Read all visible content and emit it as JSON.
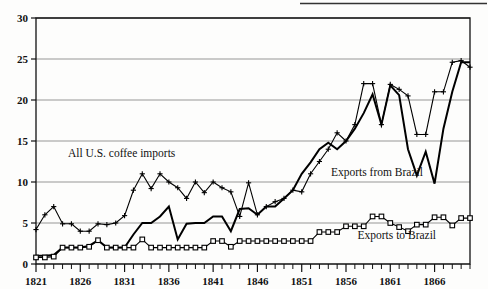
{
  "figure": {
    "background_color": "#fdfdfc",
    "ink_color": "#111111",
    "grid_color": "#6b6b6b"
  },
  "chart_data": {
    "type": "line",
    "title": "",
    "subtitle": "",
    "xlabel": "",
    "ylabel": "",
    "xlim": [
      1821,
      1870
    ],
    "ylim": [
      0,
      30
    ],
    "yticks": [
      0,
      5,
      10,
      15,
      20,
      25,
      30
    ],
    "ytick_labels": [
      "0",
      "5",
      "10",
      "15",
      "20",
      "25",
      "30"
    ],
    "xticks_labeled": [
      1821,
      1826,
      1831,
      1836,
      1841,
      1846,
      1851,
      1856,
      1861,
      1866
    ],
    "xtick_labels": [
      "1821",
      "1826",
      "1831",
      "1836",
      "1841",
      "1846",
      "1851",
      "1856",
      "1861",
      "1866"
    ],
    "xtick_minor_every": 1,
    "grid": "horizontal",
    "legend_position": "inline-annotations",
    "x": [
      1821,
      1822,
      1823,
      1824,
      1825,
      1826,
      1827,
      1828,
      1829,
      1830,
      1831,
      1832,
      1833,
      1834,
      1835,
      1836,
      1837,
      1838,
      1839,
      1840,
      1841,
      1842,
      1843,
      1844,
      1845,
      1846,
      1847,
      1848,
      1849,
      1850,
      1851,
      1852,
      1853,
      1854,
      1855,
      1856,
      1857,
      1858,
      1859,
      1860,
      1861,
      1862,
      1863,
      1864,
      1865,
      1866,
      1867,
      1868,
      1869,
      1870
    ],
    "series": [
      {
        "name": "All U.S. coffee imports",
        "marker": "plus",
        "line_width": 1.1,
        "annotation": "All U.S. coffee imports",
        "annotation_x": 1824.6,
        "annotation_y": 13.0,
        "values": [
          4.2,
          6.0,
          7.0,
          4.9,
          4.9,
          4.0,
          4.0,
          4.9,
          4.8,
          5.0,
          5.9,
          9.0,
          11.0,
          9.2,
          11.0,
          10.0,
          9.3,
          8.0,
          10.0,
          8.7,
          10.0,
          9.3,
          8.8,
          5.8,
          9.9,
          6.0,
          7.0,
          7.6,
          8.0,
          9.0,
          8.8,
          11.0,
          12.5,
          14.0,
          16.0,
          15.0,
          17.0,
          22.0,
          22.0,
          17.0,
          21.9,
          21.3,
          20.5,
          15.8,
          15.8,
          21.0,
          21.0,
          24.6,
          24.8,
          24.0
        ]
      },
      {
        "name": "Exports from Brazil",
        "marker": "none",
        "line_width": 2.0,
        "annotation": "Exports from Brazil",
        "annotation_x": 1854.3,
        "annotation_y": 10.7,
        "values": [
          1.0,
          1.0,
          1.1,
          2.0,
          2.0,
          2.0,
          2.2,
          2.9,
          2.0,
          2.0,
          2.0,
          3.6,
          5.0,
          5.0,
          5.8,
          7.0,
          3.0,
          4.9,
          5.0,
          5.0,
          5.8,
          5.8,
          4.0,
          6.7,
          6.8,
          6.0,
          7.0,
          7.0,
          8.0,
          9.0,
          11.0,
          12.4,
          14.0,
          14.8,
          14.0,
          15.0,
          16.5,
          18.4,
          20.7,
          17.0,
          21.8,
          20.6,
          14.0,
          10.8,
          13.7,
          9.8,
          16.5,
          21.0,
          24.6,
          24.6
        ]
      },
      {
        "name": "Exports to Brazil",
        "marker": "square",
        "line_width": 1.1,
        "annotation": "Exports to Brazil",
        "annotation_x": 1857.3,
        "annotation_y": 3.0,
        "values": [
          0.8,
          0.8,
          0.9,
          2.0,
          2.0,
          2.0,
          2.1,
          2.9,
          2.0,
          2.0,
          2.0,
          2.0,
          3.0,
          2.0,
          2.0,
          2.0,
          2.0,
          2.0,
          2.0,
          2.0,
          2.8,
          2.8,
          2.1,
          2.8,
          2.8,
          2.8,
          2.8,
          2.8,
          2.8,
          2.8,
          2.8,
          2.8,
          3.9,
          3.9,
          3.9,
          4.6,
          4.6,
          4.6,
          5.8,
          5.8,
          5.0,
          4.5,
          4.0,
          4.8,
          4.8,
          5.7,
          5.7,
          4.7,
          5.6,
          5.6
        ]
      }
    ],
    "annotations": [
      {
        "text": "All U.S. coffee imports",
        "x": 1824.6,
        "y": 13.0
      },
      {
        "text": "Exports from Brazil",
        "x": 1854.3,
        "y": 10.7
      },
      {
        "text": "Exports to Brazil",
        "x": 1857.3,
        "y": 3.0
      }
    ]
  }
}
